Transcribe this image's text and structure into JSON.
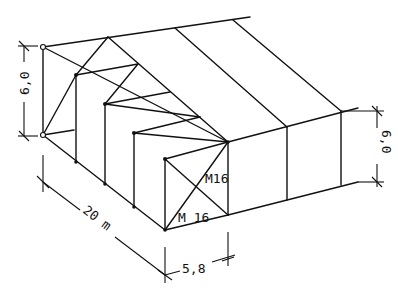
{
  "diagram": {
    "type": "isometric structural frame (hall building with bracing)",
    "stroke_color": "#111111",
    "background": "#ffffff",
    "dimensions": {
      "left_height": "6,0",
      "right_height": "6,0",
      "length": "20 m",
      "width": "5,8"
    },
    "annotations": {
      "bracing_label_upper": "M16",
      "bracing_label_lower": "M 16"
    }
  }
}
